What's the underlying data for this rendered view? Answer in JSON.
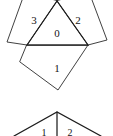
{
  "figure": {
    "stroke_color": "#2b2b2b",
    "background_color": "#ffffff",
    "top_figure": {
      "name": "triangle-with-three-squares-net",
      "center_face": {
        "id": "face-0",
        "shape": "triangle",
        "label": "0",
        "label_x": 57,
        "label_y": 33,
        "points": "57,1 27,45 88,45"
      },
      "faces": [
        {
          "id": "face-3",
          "shape": "square",
          "label": "3",
          "label_x": 34,
          "label_y": 20,
          "points": "57,1 27,45 7,42 25,-8"
        },
        {
          "id": "face-2",
          "shape": "square",
          "label": "2",
          "label_x": 78,
          "label_y": 20,
          "points": "57,1 88,45 107,40 89,-8"
        },
        {
          "id": "face-1",
          "shape": "square",
          "label": "1",
          "label_x": 57,
          "label_y": 68,
          "points": "27,45 88,45 58,90 20,62"
        }
      ]
    },
    "bottom_figure": {
      "name": "partial-second-net",
      "apex": {
        "x": 57,
        "y": 112
      },
      "edges": [
        "57,112 14,136",
        "57,112 101,136",
        "57,112 57,136"
      ],
      "labels": [
        {
          "text": "1",
          "x": 44,
          "y": 133
        },
        {
          "text": "2",
          "x": 70,
          "y": 133
        }
      ]
    }
  }
}
